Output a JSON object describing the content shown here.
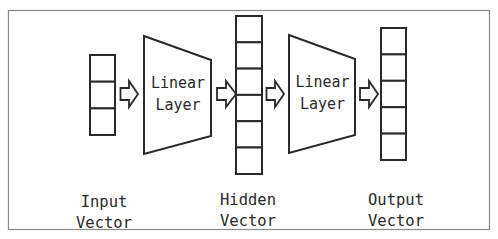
{
  "diagram": {
    "type": "neural-network-linear-layers",
    "frame": {
      "stroke": "#8a8a8a"
    },
    "colors": {
      "stroke": "#2a2a2a",
      "fill": "#ffffff",
      "background": "#ffffff"
    },
    "input_vector": {
      "cells": 3,
      "label_line1": "Input",
      "label_line2": "Vector"
    },
    "linear_layer_1": {
      "line1": "Linear",
      "line2": "Layer"
    },
    "hidden_vector": {
      "cells": 6,
      "label_line1": "Hidden",
      "label_line2": "Vector"
    },
    "linear_layer_2": {
      "line1": "Linear",
      "line2": "Layer"
    },
    "output_vector": {
      "cells": 5,
      "label_line1": "Output",
      "label_line2": "Vector"
    },
    "arrows": [
      {
        "from": "input_vector",
        "to": "linear_layer_1",
        "icon": "hollow-right-arrow-icon"
      },
      {
        "from": "linear_layer_1",
        "to": "hidden_vector",
        "icon": "hollow-right-arrow-icon"
      },
      {
        "from": "hidden_vector",
        "to": "linear_layer_2",
        "icon": "hollow-right-arrow-icon"
      },
      {
        "from": "linear_layer_2",
        "to": "output_vector",
        "icon": "hollow-right-arrow-icon"
      }
    ]
  }
}
